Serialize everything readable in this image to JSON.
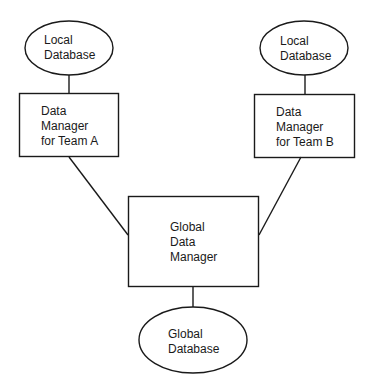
{
  "diagram": {
    "type": "architecture",
    "nodes": [
      {
        "id": "local-db-a",
        "shape": "ellipse",
        "lines": [
          "Local",
          "Database"
        ]
      },
      {
        "id": "dm-team-a",
        "shape": "rect",
        "lines": [
          "Data",
          "Manager",
          "for Team A"
        ]
      },
      {
        "id": "local-db-b",
        "shape": "ellipse",
        "lines": [
          "Local",
          "Database"
        ]
      },
      {
        "id": "dm-team-b",
        "shape": "rect",
        "lines": [
          "Data",
          "Manager",
          "for Team B"
        ]
      },
      {
        "id": "global-dm",
        "shape": "rect",
        "lines": [
          "Global",
          "Data",
          "Manager"
        ]
      },
      {
        "id": "global-db",
        "shape": "ellipse",
        "lines": [
          "Global",
          "Database"
        ]
      }
    ],
    "edges": [
      {
        "from": "local-db-a",
        "to": "dm-team-a"
      },
      {
        "from": "local-db-b",
        "to": "dm-team-b"
      },
      {
        "from": "dm-team-a",
        "to": "global-dm"
      },
      {
        "from": "dm-team-b",
        "to": "global-dm"
      },
      {
        "from": "global-dm",
        "to": "global-db"
      }
    ],
    "colors": {
      "stroke": "#1a1a1a",
      "background": "#ffffff",
      "text": "#1a1a1a"
    }
  }
}
